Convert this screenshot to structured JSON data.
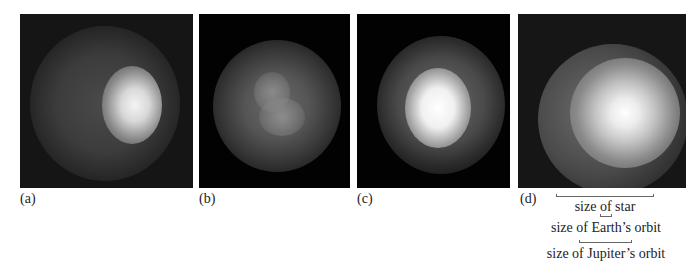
{
  "figure": {
    "panels": [
      {
        "id": "a",
        "label": "(a)"
      },
      {
        "id": "b",
        "label": "(b)"
      },
      {
        "id": "c",
        "label": "(c)"
      },
      {
        "id": "d",
        "label": "(d)"
      }
    ],
    "scale_bars": [
      {
        "id": "star",
        "caption": "size of star"
      },
      {
        "id": "earth",
        "caption": "size of Earth’s orbit"
      },
      {
        "id": "jupiter",
        "caption": "size of Jupiter’s orbit"
      }
    ]
  }
}
